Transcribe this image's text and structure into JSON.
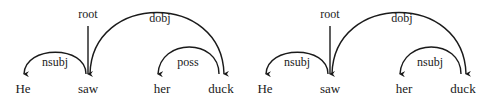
{
  "diagrams": [
    {
      "words": [
        "He",
        "saw",
        "her",
        "duck"
      ],
      "arcs": [
        {
          "label": "root"
        },
        {
          "label": "nsubj"
        },
        {
          "label": "dobj"
        },
        {
          "label": "poss"
        }
      ]
    },
    {
      "words": [
        "He",
        "saw",
        "her",
        "duck"
      ],
      "arcs": [
        {
          "label": "root"
        },
        {
          "label": "nsubj"
        },
        {
          "label": "dobj"
        },
        {
          "label": "nsubj"
        }
      ]
    }
  ]
}
